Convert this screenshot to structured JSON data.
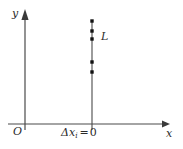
{
  "figure": {
    "width": 183,
    "height": 149,
    "background": "#ffffff"
  },
  "axes": {
    "x_axis": {
      "label": "x",
      "color": "#3a3a3a",
      "start_x": 8,
      "end_x": 165,
      "y": 124,
      "arrow": "right"
    },
    "y_axis": {
      "label": "y",
      "color": "#3a3a3a",
      "x": 25,
      "start_y": 130,
      "end_y": 12,
      "arrow": "up"
    },
    "origin": {
      "label": "O",
      "x": 16,
      "y": 131
    }
  },
  "segment": {
    "name": "L",
    "label": "L",
    "color": "#3a3a3a",
    "x": 92,
    "top_y": 20,
    "bottom_y": 130,
    "label_x": 101,
    "label_y": 36
  },
  "points": {
    "color": "#1a1a1a",
    "marker": "square-dot",
    "size": 3.4,
    "y_values": [
      21,
      31,
      39,
      62,
      72
    ]
  },
  "annotation": {
    "delta": "Δ",
    "variable": "x",
    "subscript": "i",
    "equals": "=",
    "value": "0",
    "full_text": "Δxi = 0"
  }
}
